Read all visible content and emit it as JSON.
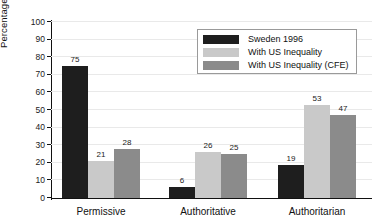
{
  "chart_data": {
    "type": "bar",
    "title": "",
    "subtitle": "",
    "xlabel": "",
    "ylabel": "Percentage of parents",
    "ylim": [
      0,
      100
    ],
    "ytick_step": 10,
    "yticks": [
      0,
      10,
      20,
      30,
      40,
      50,
      60,
      70,
      80,
      90,
      100
    ],
    "ytick_labels": [
      "0",
      "10",
      "20",
      "30",
      "40",
      "50",
      "60",
      "70",
      "80",
      "90",
      "100"
    ],
    "grid": true,
    "grid_axis": "y",
    "legend_position": "top-right",
    "categories": [
      "Permissive",
      "Authoritative",
      "Authoritarian"
    ],
    "series": [
      {
        "name": "Sweden 1996",
        "color": "#1e1e1e",
        "values": [
          75,
          6,
          19
        ],
        "labels": [
          "75",
          "6",
          "19"
        ]
      },
      {
        "name": "With US Inequality",
        "color": "#c9c9c9",
        "values": [
          21,
          26,
          53
        ],
        "labels": [
          "21",
          "26",
          "53"
        ]
      },
      {
        "name": "With US Inequality (CFE)",
        "color": "#8b8b8b",
        "values": [
          28,
          25,
          47
        ],
        "labels": [
          "28",
          "25",
          "47"
        ]
      }
    ],
    "bar_value_labels_shown": true
  },
  "legend": {
    "entries": [
      {
        "label": "Sweden 1996",
        "color": "#1e1e1e"
      },
      {
        "label": "With US Inequality",
        "color": "#c9c9c9"
      },
      {
        "label": "With US Inequality (CFE)",
        "color": "#8b8b8b"
      }
    ]
  },
  "colors": {
    "background": "#ffffff",
    "axis": "#111111",
    "gridline": "#e9e9e9",
    "text": "#111111",
    "series_dark": "#1e1e1e",
    "series_light": "#c9c9c9",
    "series_medium": "#8b8b8b"
  }
}
